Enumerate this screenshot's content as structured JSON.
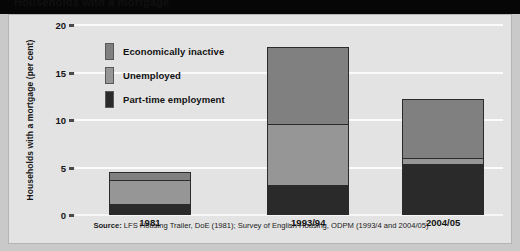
{
  "figure": {
    "title_strip_text": "Households with a mortgage",
    "source_lead": "Source:",
    "source_text": "LFS Housing Trailer, DoE (1981); Survey of English Housing, ODPM (1993/4 and 2004/05)"
  },
  "colors": {
    "economically_inactive": "#808080",
    "unemployed": "#969696",
    "part_time_employment": "#2a2a2a",
    "plot_background": "#e3e3e3",
    "gridline": "#fbfbfb",
    "bar_outline": "#2b2b2b",
    "page_background": "#c9c9c9",
    "title_strip": "#060606"
  },
  "legend": {
    "items": [
      {
        "label": "Economically inactive",
        "color_key": "economically_inactive"
      },
      {
        "label": "Unemployed",
        "color_key": "unemployed"
      },
      {
        "label": "Part-time employment",
        "color_key": "part_time_employment"
      }
    ]
  },
  "chart_data": {
    "type": "bar",
    "subtype": "stacked-vertical",
    "title": "Households with a mortgage",
    "xlabel": "",
    "ylabel": "Households with a mortgage (per cent)",
    "categories": [
      "1981",
      "1993/94",
      "2004/05"
    ],
    "ylim": [
      0,
      20
    ],
    "yticks": [
      0,
      5,
      10,
      15,
      20
    ],
    "ytick_labels": [
      "0",
      "5",
      "10",
      "15",
      "20"
    ],
    "grid": true,
    "grid_axis": "y",
    "legend_position": "inside-upper-left",
    "series": [
      {
        "name": "Part-time employment",
        "color": "#2a2a2a",
        "values": [
          1.1,
          3.1,
          5.4
        ]
      },
      {
        "name": "Unemployed",
        "color": "#969696",
        "values": [
          2.6,
          6.5,
          0.6
        ]
      },
      {
        "name": "Economically inactive",
        "color": "#808080",
        "values": [
          0.8,
          8.1,
          6.2
        ]
      }
    ],
    "totals": [
      4.5,
      17.7,
      12.2
    ],
    "stack_order_bottom_to_top": [
      "Part-time employment",
      "Unemployed",
      "Economically inactive"
    ]
  }
}
